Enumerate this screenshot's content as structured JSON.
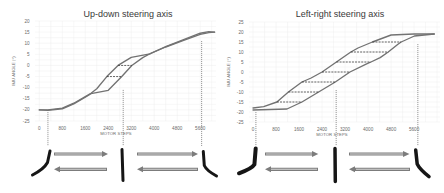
{
  "chart_data": [
    {
      "type": "line",
      "title": "Up-down steering axis",
      "xlabel": "MOTOR STEPS",
      "ylabel": "IMU ANGLE (°)",
      "xticks": [
        0,
        800,
        1600,
        2400,
        3200,
        4000,
        4800,
        5600
      ],
      "yticks": [
        20,
        15,
        10,
        5,
        0,
        -5,
        -10,
        -15,
        -20,
        -25
      ],
      "xlim": [
        -150,
        6150
      ],
      "ylim": [
        -25,
        20
      ],
      "grid": {
        "on": true,
        "x_step": 400,
        "y_step": 2.5
      },
      "legend": null,
      "series": [
        {
          "name": "branch-a",
          "color": "#727272",
          "points": [
            [
              0,
              -20
            ],
            [
              300,
              -20
            ],
            [
              800,
              -19.2
            ],
            [
              1200,
              -17
            ],
            [
              1600,
              -14
            ],
            [
              1800,
              -12.5
            ],
            [
              2000,
              -10.5
            ],
            [
              2350,
              -5
            ],
            [
              2740,
              0
            ],
            [
              3200,
              3.6
            ],
            [
              3850,
              5.2
            ],
            [
              4400,
              8.5
            ],
            [
              5000,
              11.5
            ],
            [
              5600,
              14.5
            ],
            [
              5900,
              15.2
            ],
            [
              6100,
              15
            ]
          ]
        },
        {
          "name": "branch-b",
          "color": "#727272",
          "points": [
            [
              0,
              -20
            ],
            [
              300,
              -20.2
            ],
            [
              800,
              -19.5
            ],
            [
              1200,
              -17.3
            ],
            [
              1600,
              -14.3
            ],
            [
              1800,
              -12.7
            ],
            [
              2400,
              -11.2
            ],
            [
              2870,
              -5
            ],
            [
              3220,
              0
            ],
            [
              3600,
              3.5
            ],
            [
              3900,
              5.6
            ],
            [
              4400,
              8.3
            ],
            [
              5000,
              11.2
            ],
            [
              5600,
              14
            ],
            [
              5900,
              14.8
            ],
            [
              6100,
              15
            ]
          ]
        }
      ],
      "hysteresis_dashes": [
        {
          "y": -5,
          "x_from": 2350,
          "x_to": 2870
        },
        {
          "y": 0,
          "x_from": 2740,
          "x_to": 3220
        }
      ],
      "position_markers": [
        {
          "x": 300,
          "y_top": -21
        },
        {
          "x": 2920,
          "y_top": -11
        },
        {
          "x": 5650,
          "y_top": 11
        }
      ]
    },
    {
      "type": "line",
      "title": "Left-right steering axis",
      "xlabel": "MOTOR STEPS",
      "ylabel": "IMU ANGLE (°)",
      "xticks": [
        0,
        800,
        1600,
        2400,
        3200,
        4000,
        4800,
        5600
      ],
      "yticks": [
        25,
        20,
        15,
        10,
        5,
        0,
        -5,
        -10,
        -15,
        -20,
        -25
      ],
      "xlim": [
        -140,
        6500
      ],
      "ylim": [
        -25,
        25
      ],
      "grid": {
        "on": true,
        "x_step": 400,
        "y_step": 2.5
      },
      "legend": null,
      "series": [
        {
          "name": "branch-a",
          "color": "#727272",
          "points": [
            [
              0,
              -18
            ],
            [
              370,
              -17.3
            ],
            [
              830,
              -15
            ],
            [
              1230,
              -10
            ],
            [
              1700,
              -5
            ],
            [
              2020,
              -3
            ],
            [
              2400,
              0
            ],
            [
              2900,
              5
            ],
            [
              3400,
              10
            ],
            [
              3650,
              12
            ],
            [
              4150,
              15
            ],
            [
              4800,
              18.5
            ],
            [
              5600,
              19
            ],
            [
              6300,
              19
            ]
          ]
        },
        {
          "name": "branch-b",
          "color": "#727272",
          "points": [
            [
              0,
              -19
            ],
            [
              1180,
              -18.5
            ],
            [
              1700,
              -15
            ],
            [
              2280,
              -10
            ],
            [
              2860,
              -5
            ],
            [
              3370,
              0
            ],
            [
              3950,
              4.1
            ],
            [
              4100,
              5
            ],
            [
              4420,
              7.2
            ],
            [
              4700,
              10
            ],
            [
              5050,
              14
            ],
            [
              5150,
              15
            ],
            [
              5610,
              18
            ],
            [
              6300,
              19
            ]
          ]
        }
      ],
      "hysteresis_dashes": [
        {
          "y": -15,
          "x_from": 830,
          "x_to": 1700
        },
        {
          "y": -10,
          "x_from": 1230,
          "x_to": 2280
        },
        {
          "y": -5,
          "x_from": 1700,
          "x_to": 2860
        },
        {
          "y": 0,
          "x_from": 2400,
          "x_to": 3370
        },
        {
          "y": 5,
          "x_from": 2900,
          "x_to": 4100
        },
        {
          "y": 10,
          "x_from": 3400,
          "x_to": 4700
        },
        {
          "y": 15,
          "x_from": 4150,
          "x_to": 5150
        }
      ],
      "position_markers": [
        {
          "x": 100,
          "y_top": -20
        },
        {
          "x": 2890,
          "y_top": -9
        },
        {
          "x": 5730,
          "y_top": 14
        }
      ]
    }
  ],
  "illustrations": [
    {
      "panel": "Up-down steering axis",
      "items": [
        "bent-joint-left-icon",
        "arrow-right-icon",
        "arrow-left-icon",
        "straight-joint-icon",
        "arrow-right-icon",
        "arrow-left-icon",
        "bent-joint-right-icon"
      ]
    },
    {
      "panel": "Left-right steering axis",
      "items": [
        "bent-joint-left-icon",
        "arrow-right-icon",
        "arrow-left-icon",
        "straight-joint-icon",
        "arrow-right-icon",
        "arrow-left-icon",
        "bent-joint-right-icon"
      ]
    }
  ]
}
